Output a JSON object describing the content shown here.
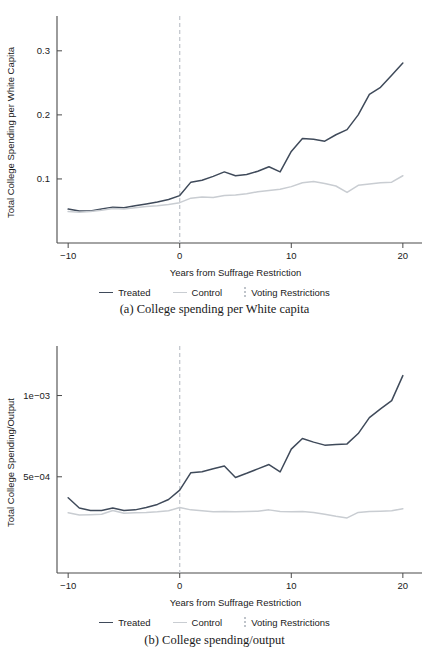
{
  "figure": {
    "panels": [
      {
        "id": "panel-a",
        "caption": "(a) College spending per White capita",
        "chart_data": {
          "type": "line",
          "title": "",
          "xlabel": "Years from Suffrage Restriction",
          "ylabel": "Total College Spending per White Capita",
          "xlim": [
            -11,
            21
          ],
          "ylim": [
            0.0,
            0.345
          ],
          "xticks": [
            -10,
            0,
            10,
            20
          ],
          "xticklabels": [
            "-10",
            "0",
            "10",
            "20"
          ],
          "yticks": [
            0.1,
            0.2,
            0.3
          ],
          "yticklabels": [
            "0.1",
            "0.2",
            "0.3"
          ],
          "grid": false,
          "yscale": "linear",
          "legend_position": "below",
          "annotations": [
            {
              "type": "vline",
              "x": 0,
              "label": "Voting Restrictions",
              "style": "dashed"
            }
          ],
          "x": [
            -10,
            -9,
            -8,
            -7,
            -6,
            -5,
            -4,
            -3,
            -2,
            -1,
            0,
            1,
            2,
            3,
            4,
            5,
            6,
            7,
            8,
            9,
            10,
            11,
            12,
            13,
            14,
            15,
            16,
            17,
            18,
            19,
            20
          ],
          "series": [
            {
              "name": "Treated",
              "color": "#3f4a5a",
              "values": [
                0.053,
                0.05,
                0.05,
                0.053,
                0.056,
                0.055,
                0.058,
                0.061,
                0.064,
                0.068,
                0.074,
                0.095,
                0.098,
                0.104,
                0.111,
                0.105,
                0.107,
                0.112,
                0.119,
                0.111,
                0.143,
                0.163,
                0.162,
                0.159,
                0.169,
                0.177,
                0.2,
                0.232,
                0.243,
                0.262,
                0.281
              ]
            },
            {
              "name": "Control",
              "color": "#c9cdd2",
              "values": [
                0.049,
                0.048,
                0.049,
                0.051,
                0.054,
                0.053,
                0.055,
                0.057,
                0.058,
                0.06,
                0.063,
                0.07,
                0.072,
                0.071,
                0.074,
                0.075,
                0.077,
                0.08,
                0.082,
                0.084,
                0.088,
                0.094,
                0.096,
                0.093,
                0.089,
                0.079,
                0.09,
                0.092,
                0.094,
                0.095,
                0.105
              ]
            }
          ]
        },
        "legend": [
          {
            "label": "Treated",
            "marker": "line",
            "color": "#3f4a5a"
          },
          {
            "label": "Control",
            "marker": "line",
            "color": "#c9cdd2"
          },
          {
            "label": "Voting Restrictions",
            "marker": "dashed-vline",
            "color": "#bfc4ca"
          }
        ]
      },
      {
        "id": "panel-b",
        "caption": "(b) College spending/output",
        "chart_data": {
          "type": "line",
          "title": "",
          "xlabel": "Years from Suffrage Restriction",
          "ylabel": "Total College Spending/Output",
          "xlim": [
            -11,
            21
          ],
          "ylim": [
            0.00022,
            0.00145
          ],
          "xticks": [
            -10,
            0,
            10,
            20
          ],
          "xticklabels": [
            "-10",
            "0",
            "10",
            "20"
          ],
          "yticks": [
            0.0005,
            0.001
          ],
          "yticklabels": [
            "5e-04",
            "1e-03"
          ],
          "grid": false,
          "yscale": "log",
          "legend_position": "below",
          "annotations": [
            {
              "type": "vline",
              "x": 0,
              "label": "Voting Restrictions",
              "style": "dashed"
            }
          ],
          "x": [
            -10,
            -9,
            -8,
            -7,
            -6,
            -5,
            -4,
            -3,
            -2,
            -1,
            0,
            1,
            2,
            3,
            4,
            5,
            6,
            7,
            8,
            9,
            10,
            11,
            12,
            13,
            14,
            15,
            16,
            17,
            18,
            19,
            20
          ],
          "series": [
            {
              "name": "Treated",
              "color": "#3f4a5a",
              "values": [
                0.000418,
                0.000383,
                0.000375,
                0.000375,
                0.000383,
                0.000375,
                0.000377,
                0.000385,
                0.000395,
                0.000412,
                0.000446,
                0.000518,
                0.000522,
                0.000535,
                0.000548,
                0.000497,
                0.000515,
                0.000535,
                0.000555,
                0.000521,
                0.000633,
                0.000693,
                0.000672,
                0.000655,
                0.000658,
                0.000662,
                0.000723,
                0.000828,
                0.000893,
                0.000958,
                0.001185
              ]
            },
            {
              "name": "Control",
              "color": "#c9cdd2",
              "values": [
                0.000368,
                0.000361,
                0.000362,
                0.000363,
                0.000375,
                0.000366,
                0.000368,
                0.000369,
                0.000371,
                0.000374,
                0.000385,
                0.000377,
                0.000374,
                0.000371,
                0.000372,
                0.000371,
                0.000372,
                0.000373,
                0.000377,
                0.000372,
                0.000371,
                0.000372,
                0.000369,
                0.000363,
                0.000357,
                0.000352,
                0.000369,
                0.000372,
                0.000373,
                0.000374,
                0.000381
              ]
            }
          ]
        },
        "legend": [
          {
            "label": "Treated",
            "marker": "line",
            "color": "#3f4a5a"
          },
          {
            "label": "Control",
            "marker": "line",
            "color": "#c9cdd2"
          },
          {
            "label": "Voting Restrictions",
            "marker": "dashed-vline",
            "color": "#bfc4ca"
          }
        ]
      }
    ]
  }
}
